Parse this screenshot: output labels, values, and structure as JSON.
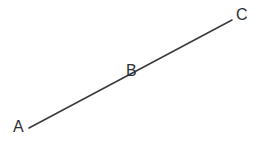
{
  "diagram": {
    "type": "line-segment-with-labeled-points",
    "background_color": "#ffffff",
    "canvas": {
      "width": 263,
      "height": 146
    },
    "line": {
      "name": "segment-AC",
      "color": "#3b3b40",
      "stroke_width": 1.6,
      "start": {
        "x": 29,
        "y": 128
      },
      "end": {
        "x": 232,
        "y": 20
      }
    },
    "points": [
      {
        "id": "A",
        "label": "A",
        "position": {
          "x": 29,
          "y": 128
        },
        "label_position": {
          "x": 13,
          "y": 119
        },
        "color": "#2e2e33"
      },
      {
        "id": "B",
        "label": "B",
        "position": {
          "x": 132,
          "y": 73
        },
        "label_position": {
          "x": 126,
          "y": 63
        },
        "color": "#2e2e33"
      },
      {
        "id": "C",
        "label": "C",
        "position": {
          "x": 232,
          "y": 20
        },
        "label_position": {
          "x": 236,
          "y": 7
        },
        "color": "#2e2e33"
      }
    ]
  }
}
